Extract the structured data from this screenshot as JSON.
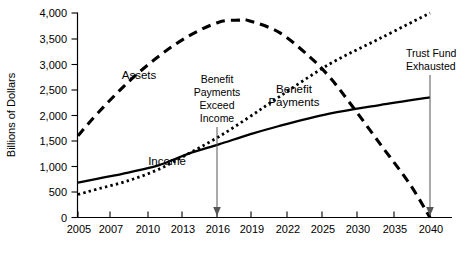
{
  "chart_data": {
    "type": "line",
    "title": "",
    "xlabel": "",
    "ylabel": "Billions of Dollars",
    "xlim": [
      2005,
      2040
    ],
    "ylim": [
      0,
      4000
    ],
    "grid": false,
    "legend_position": "inline-labels",
    "x_tick_labels": [
      "2005",
      "2007",
      "2010",
      "2013",
      "2016",
      "2019",
      "2022",
      "2025",
      "2030",
      "2035",
      "2040"
    ],
    "x_tick_values": [
      2005,
      2007,
      2010,
      2013,
      2016,
      2019,
      2022,
      2025,
      2030,
      2035,
      2040
    ],
    "y_tick_labels": [
      "0",
      "500",
      "1,000",
      "1,500",
      "2,000",
      "2,500",
      "3,000",
      "3,500",
      "4,000"
    ],
    "y_tick_values": [
      0,
      500,
      1000,
      1500,
      2000,
      2500,
      3000,
      3500,
      4000
    ],
    "series": [
      {
        "name": "Assets",
        "style": "long-dashed",
        "x": [
          2005,
          2007,
          2010,
          2013,
          2016,
          2019,
          2021,
          2022,
          2025,
          2028,
          2030,
          2032,
          2035,
          2038,
          2040
        ],
        "values": [
          1600,
          2050,
          2650,
          3150,
          3550,
          3820,
          3860,
          3850,
          3620,
          3150,
          2750,
          2250,
          1450,
          650,
          0
        ]
      },
      {
        "name": "Benefit Payments",
        "style": "dotted",
        "x": [
          2005,
          2007,
          2010,
          2013,
          2016,
          2019,
          2022,
          2025,
          2030,
          2035,
          2040
        ],
        "values": [
          450,
          560,
          720,
          940,
          1250,
          1580,
          1960,
          2360,
          3000,
          3500,
          4000
        ]
      },
      {
        "name": "Income",
        "style": "solid",
        "x": [
          2005,
          2007,
          2010,
          2013,
          2016,
          2019,
          2022,
          2025,
          2030,
          2035,
          2040
        ],
        "values": [
          680,
          760,
          880,
          1020,
          1250,
          1430,
          1620,
          1790,
          2030,
          2200,
          2350
        ]
      }
    ],
    "annotations": [
      {
        "id": "benefit-payments-exceed-income",
        "lines": [
          "Benefit",
          "Payments",
          "Exceed",
          "Income"
        ],
        "x": 2016,
        "arrow_to_y": 0
      },
      {
        "id": "trust-fund-exhausted",
        "lines": [
          "Trust Fund",
          "Exhausted"
        ],
        "x": 2040,
        "arrow_to_y": 0
      }
    ],
    "series_labels": [
      {
        "name": "Assets",
        "text": "Assets"
      },
      {
        "name": "Benefit Payments",
        "line1": "Benefit",
        "line2": "Payments"
      },
      {
        "name": "Income",
        "text": "Income"
      }
    ]
  }
}
